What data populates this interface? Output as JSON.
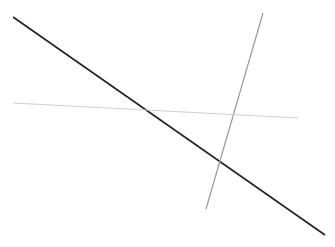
{
  "canvas": {
    "width": 335,
    "height": 247,
    "background": "#ffffff"
  },
  "lines": [
    {
      "name": "dark-diagonal-line",
      "x1": 13,
      "y1": 17,
      "x2": 325,
      "y2": 235,
      "color": "#222222",
      "width": 1.6
    },
    {
      "name": "grey-steep-line",
      "x1": 263,
      "y1": 13,
      "x2": 206,
      "y2": 209,
      "color": "#9a9a9a",
      "width": 1.2
    },
    {
      "name": "light-horizontal-line",
      "x1": 13,
      "y1": 103,
      "x2": 298,
      "y2": 118,
      "color": "#cfcfcf",
      "width": 1.1
    }
  ]
}
